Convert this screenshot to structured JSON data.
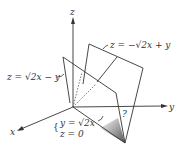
{
  "diagram": {
    "axes": {
      "x_label": "x",
      "y_label": "y",
      "z_label": "z"
    },
    "planes": [
      {
        "name": "plane-1",
        "equation": "z = −√2x + y"
      },
      {
        "name": "plane-2",
        "equation": "z = √2x − y"
      }
    ],
    "intersection_line": {
      "line1": "y = √2x",
      "line2": "z = 0"
    },
    "angle_label": "?"
  }
}
